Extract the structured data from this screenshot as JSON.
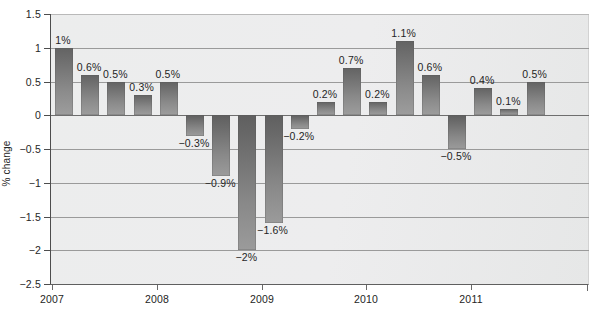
{
  "chart_data": {
    "type": "bar",
    "title": "",
    "xlabel": "",
    "ylabel": "% change",
    "ylim": [
      -2.5,
      1.5
    ],
    "yticks": [
      "1.5",
      "1",
      "0.5",
      "0",
      "-0.5",
      "-1",
      "-1.5",
      "-2",
      "-2.5"
    ],
    "ytick_values": [
      1.5,
      1,
      0.5,
      0,
      -0.5,
      -1,
      -1.5,
      -2,
      -2.5
    ],
    "grid": true,
    "legend": "none",
    "xticks": [
      "2007",
      "2008",
      "2009",
      "2010",
      "2011"
    ],
    "categories": [
      "2007 Q1",
      "2007 Q2",
      "2007 Q3",
      "2007 Q4",
      "2008 Q1",
      "2008 Q2",
      "2008 Q3",
      "2008 Q4",
      "2009 Q1",
      "2009 Q2",
      "2009 Q3",
      "2009 Q4",
      "2010 Q1",
      "2010 Q2",
      "2010 Q3",
      "2010 Q4",
      "2011 Q1",
      "2011 Q2",
      "2011 Q3"
    ],
    "values": [
      1,
      0.6,
      0.5,
      0.3,
      0.5,
      -0.3,
      -0.9,
      -2,
      -1.6,
      -0.2,
      0.2,
      0.7,
      0.2,
      1.1,
      0.6,
      -0.5,
      0.4,
      0.1,
      0.5
    ],
    "data_labels": [
      "1%",
      "0.6%",
      "0.5%",
      "0.3%",
      "0.5%",
      "−0.3%",
      "−0.9%",
      "−2%",
      "−1.6%",
      "−0.2%",
      "0.2%",
      "0.7%",
      "0.2%",
      "1.1%",
      "0.6%",
      "−0.5%",
      "0.4%",
      "0.1%",
      "0.5%"
    ],
    "colors": {
      "bar_top": "#636363",
      "bar_bottom": "#9d9d9d",
      "plot_background": "#ededee",
      "gridline": "#9a9a9a",
      "axis": "#4d4d4d",
      "text": "#222222"
    }
  }
}
